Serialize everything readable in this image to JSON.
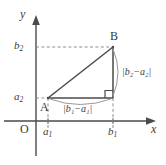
{
  "figure": {
    "type": "coordinate-geometry-diagram",
    "colors": {
      "stroke": "#4a4a4a",
      "dashed_stroke": "#8c8c8c",
      "text": "#3b3b3b",
      "background": "#ffffff",
      "arc_stroke": "#9a9a9a"
    },
    "axes": {
      "x_label": "x",
      "y_label": "y",
      "origin_label": "O"
    },
    "ticks": {
      "x": [
        {
          "id": "a1",
          "base": "a",
          "sub": "1"
        },
        {
          "id": "b1",
          "base": "b",
          "sub": "1"
        }
      ],
      "y": [
        {
          "id": "a2",
          "base": "a",
          "sub": "2"
        },
        {
          "id": "b2",
          "base": "b",
          "sub": "2"
        }
      ]
    },
    "points": [
      {
        "name": "A",
        "label": "A"
      },
      {
        "name": "B",
        "label": "B"
      }
    ],
    "distance_labels": {
      "horizontal": "|b₁−a₁|",
      "vertical": "|b₂−a₂|"
    },
    "markers": {
      "right_angle": "right-angle-square"
    }
  }
}
